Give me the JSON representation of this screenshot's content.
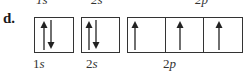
{
  "question": {
    "label": "d."
  },
  "top_labels_cut": [
    "1s",
    "2s",
    "2p"
  ],
  "orbitals": [
    {
      "name": "1s",
      "num": "1",
      "letter": "s",
      "boxes": [
        [
          "up",
          "down"
        ]
      ]
    },
    {
      "name": "2s",
      "num": "2",
      "letter": "s",
      "boxes": [
        [
          "up",
          "down"
        ]
      ]
    },
    {
      "name": "2p",
      "num": "2",
      "letter": "p",
      "boxes": [
        [
          "up"
        ],
        [
          "up"
        ],
        [
          "up"
        ]
      ]
    }
  ],
  "colors": {
    "line": "#333333",
    "text": "#1a1a1a"
  }
}
